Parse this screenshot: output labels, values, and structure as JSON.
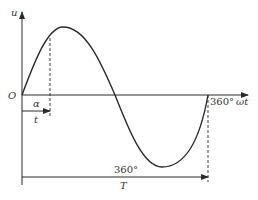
{
  "diagram": {
    "y_axis_label": "u",
    "x_axis_label": "ωt",
    "origin_label": "O",
    "x_end_label": "360°",
    "phase_label": "α",
    "time_label": "t",
    "period_angle_label": "360°",
    "period_label": "T",
    "colors": {
      "stroke": "#2a2a2a",
      "text": "#333333"
    }
  }
}
